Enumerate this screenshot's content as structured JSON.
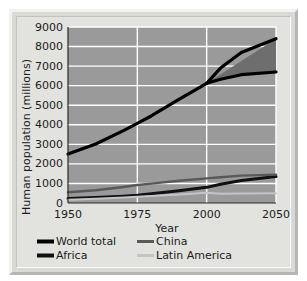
{
  "chart_data": {
    "type": "line",
    "title": "",
    "xlabel": "Year",
    "ylabel": "Human population (millions)",
    "xlim": [
      1950,
      2050
    ],
    "ylim": [
      0,
      9000
    ],
    "xticks": [
      1950,
      1975,
      2000,
      2050
    ],
    "xtick_labels": [
      "1950",
      "1975",
      "2000",
      "2050"
    ],
    "yticks": [
      0,
      1000,
      2000,
      3000,
      4000,
      5000,
      6000,
      7000,
      8000,
      9000
    ],
    "ytick_labels": [
      "0",
      "1000",
      "2000",
      "3000",
      "4000",
      "5000",
      "6000",
      "7000",
      "8000",
      "9000"
    ],
    "grid": "horizontal-and-vertical",
    "grid_color": "#ffffff",
    "plot_background": "#9a9a9a",
    "legend_position": "below-axes",
    "projection_band": {
      "label": "projection range",
      "fill_color": "#6e6e6e",
      "start_year": 2000,
      "high": [
        {
          "x": 2000,
          "y": 6120
        },
        {
          "x": 2050,
          "y": 8400
        }
      ],
      "low": [
        {
          "x": 2000,
          "y": 6120
        },
        {
          "x": 2025,
          "y": 6500
        },
        {
          "x": 2050,
          "y": 6700
        }
      ]
    },
    "series": [
      {
        "name": "World total",
        "color": "#000000",
        "width": 3.2,
        "x": [
          1950,
          1960,
          1970,
          1975,
          1980,
          1990,
          2000,
          2010,
          2025,
          2050
        ],
        "values": [
          2500,
          3020,
          3700,
          4070,
          4450,
          5300,
          6120,
          6900,
          7700,
          8400
        ]
      },
      {
        "name": "World total low projection",
        "color": "#000000",
        "width": 3.2,
        "x": [
          2000,
          2010,
          2025,
          2050
        ],
        "values": [
          6120,
          6330,
          6560,
          6700
        ]
      },
      {
        "name": "Africa",
        "color": "#111111",
        "width": 3.0,
        "x": [
          1950,
          1960,
          1970,
          1975,
          1980,
          1990,
          2000,
          2010,
          2025,
          2050
        ],
        "values": [
          230,
          280,
          350,
          400,
          470,
          630,
          800,
          960,
          1150,
          1350
        ]
      },
      {
        "name": "China",
        "color": "#595959",
        "width": 2.4,
        "x": [
          1950,
          1960,
          1970,
          1975,
          1980,
          1990,
          2000,
          2010,
          2025,
          2050
        ],
        "values": [
          550,
          650,
          820,
          920,
          990,
          1140,
          1260,
          1320,
          1400,
          1450
        ]
      },
      {
        "name": "Latin America",
        "color": "#c4c4c4",
        "width": 2.0,
        "x": [
          1950,
          1960,
          1970,
          1975,
          1980,
          1990,
          2000,
          2010,
          2025,
          2050
        ],
        "values": [
          170,
          215,
          285,
          320,
          360,
          440,
          520,
          470,
          490,
          500
        ]
      }
    ],
    "legend": [
      {
        "label": "World total",
        "color": "#000000",
        "width": 4
      },
      {
        "label": "China",
        "color": "#595959",
        "width": 3
      },
      {
        "label": "Africa",
        "color": "#111111",
        "width": 4
      },
      {
        "label": "Latin America",
        "color": "#c4c4c4",
        "width": 3
      }
    ]
  }
}
